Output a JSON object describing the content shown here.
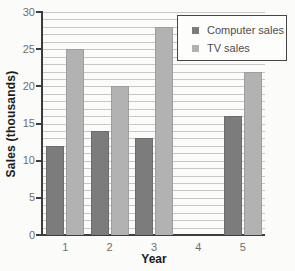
{
  "chart_data": {
    "type": "bar",
    "title": "",
    "xlabel": "Year",
    "ylabel": "Sales (thousands)",
    "categories": [
      "1",
      "2",
      "3",
      "4",
      "5"
    ],
    "series": [
      {
        "name": "Computer sales",
        "color": "#7c7c7c",
        "values": [
          12,
          14,
          13,
          null,
          16
        ]
      },
      {
        "name": "TV sales",
        "color": "#b2b2b2",
        "values": [
          25,
          20,
          28,
          null,
          22
        ]
      }
    ],
    "ylim": [
      0,
      30
    ],
    "yticks": [
      0,
      5,
      10,
      15,
      20,
      25,
      30
    ],
    "minor_gridline_step": 1,
    "grid": "horizontal",
    "legend_position": "top-right",
    "colors": {
      "gridline": "#c7c7c7",
      "axis": "#3d3d3d",
      "tick_label": "#6f6f6f",
      "axis_label": "#1b1b1b",
      "legend_text": "#4d4d4d",
      "legend_border": "#454545",
      "background": "#fbfbf9"
    }
  }
}
